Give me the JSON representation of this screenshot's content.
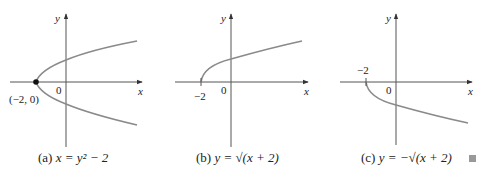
{
  "panels": [
    {
      "id": "a",
      "caption_prefix": "(a)",
      "equation": "x = y² − 2",
      "axis_x_label": "x",
      "axis_y_label": "y",
      "origin_label": "0",
      "point_label": "(−2, 0)",
      "curve_color": "#8a8a8a"
    },
    {
      "id": "b",
      "caption_prefix": "(b)",
      "equation": "y = √(x + 2)",
      "axis_x_label": "x",
      "axis_y_label": "y",
      "origin_label": "0",
      "tick_label": "−2",
      "curve_color": "#8a8a8a"
    },
    {
      "id": "c",
      "caption_prefix": "(c)",
      "equation": "y = −√(x + 2)",
      "axis_x_label": "x",
      "axis_y_label": "y",
      "origin_label": "0",
      "tick_label": "−2",
      "curve_color": "#8a8a8a"
    }
  ],
  "end_marker": "■"
}
